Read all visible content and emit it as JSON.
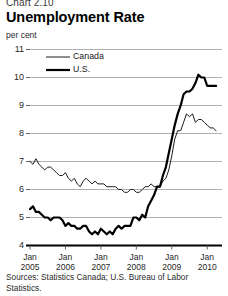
{
  "header": {
    "chart_number": "Chart 2.10",
    "title": "Unemployment Rate",
    "unit_label": "per cent"
  },
  "footer": {
    "sources": "Sources: Statistics Canada; U.S. Bureau of Labor Statistics."
  },
  "legend": {
    "items": [
      {
        "label": "Canada",
        "color": "#1a1a1a",
        "width": 1.0
      },
      {
        "label": "U.S.",
        "color": "#000000",
        "width": 2.2
      }
    ]
  },
  "chart_data": {
    "type": "line",
    "title": "Unemployment Rate",
    "subtitle": "Chart 2.10",
    "xlabel": "",
    "ylabel": "per cent",
    "ylim": [
      4,
      11
    ],
    "yticks": [
      4,
      5,
      6,
      7,
      8,
      9,
      10,
      11
    ],
    "xlim": [
      "2005-01",
      "2010-06"
    ],
    "xticks": [
      "Jan 2005",
      "Jan 2006",
      "Jan 2007",
      "Jan 2008",
      "Jan 2009",
      "Jan 2010"
    ],
    "xtick_labels": [
      {
        "month": "Jan",
        "year": "2005"
      },
      {
        "month": "Jan",
        "year": "2006"
      },
      {
        "month": "Jan",
        "year": "2007"
      },
      {
        "month": "Jan",
        "year": "2008"
      },
      {
        "month": "Jan",
        "year": "2009"
      },
      {
        "month": "Jan",
        "year": "2010"
      }
    ],
    "grid": "horizontal",
    "legend_position": "upper-left",
    "x": [
      "2005-01",
      "2005-02",
      "2005-03",
      "2005-04",
      "2005-05",
      "2005-06",
      "2005-07",
      "2005-08",
      "2005-09",
      "2005-10",
      "2005-11",
      "2005-12",
      "2006-01",
      "2006-02",
      "2006-03",
      "2006-04",
      "2006-05",
      "2006-06",
      "2006-07",
      "2006-08",
      "2006-09",
      "2006-10",
      "2006-11",
      "2006-12",
      "2007-01",
      "2007-02",
      "2007-03",
      "2007-04",
      "2007-05",
      "2007-06",
      "2007-07",
      "2007-08",
      "2007-09",
      "2007-10",
      "2007-11",
      "2007-12",
      "2008-01",
      "2008-02",
      "2008-03",
      "2008-04",
      "2008-05",
      "2008-06",
      "2008-07",
      "2008-08",
      "2008-09",
      "2008-10",
      "2008-11",
      "2008-12",
      "2009-01",
      "2009-02",
      "2009-03",
      "2009-04",
      "2009-05",
      "2009-06",
      "2009-07",
      "2009-08",
      "2009-09",
      "2009-10",
      "2009-11",
      "2009-12",
      "2010-01",
      "2010-02",
      "2010-03",
      "2010-04"
    ],
    "series": [
      {
        "name": "Canada",
        "color": "#1a1a1a",
        "line_width": 1.0,
        "values": [
          7.0,
          6.9,
          7.1,
          6.9,
          6.8,
          6.7,
          6.8,
          6.8,
          6.7,
          6.6,
          6.5,
          6.5,
          6.6,
          6.4,
          6.3,
          6.4,
          6.2,
          6.1,
          6.3,
          6.4,
          6.3,
          6.2,
          6.3,
          6.2,
          6.2,
          6.2,
          6.1,
          6.1,
          6.1,
          6.1,
          6.0,
          6.0,
          5.9,
          5.9,
          6.0,
          6.0,
          5.9,
          5.9,
          6.0,
          6.1,
          6.1,
          6.2,
          6.1,
          6.1,
          6.1,
          6.3,
          6.4,
          6.7,
          7.2,
          7.8,
          8.1,
          8.1,
          8.4,
          8.7,
          8.6,
          8.7,
          8.4,
          8.5,
          8.5,
          8.4,
          8.3,
          8.2,
          8.2,
          8.1
        ]
      },
      {
        "name": "U.S.",
        "color": "#000000",
        "line_width": 2.2,
        "values": [
          5.3,
          5.4,
          5.2,
          5.2,
          5.1,
          5.0,
          5.0,
          4.9,
          5.0,
          5.0,
          5.0,
          4.9,
          4.7,
          4.8,
          4.7,
          4.7,
          4.6,
          4.6,
          4.7,
          4.7,
          4.5,
          4.4,
          4.5,
          4.4,
          4.6,
          4.5,
          4.4,
          4.5,
          4.4,
          4.6,
          4.7,
          4.6,
          4.7,
          4.7,
          4.7,
          5.0,
          5.0,
          4.9,
          5.1,
          5.0,
          5.4,
          5.6,
          5.8,
          6.1,
          6.1,
          6.5,
          6.8,
          7.3,
          7.8,
          8.3,
          8.7,
          9.0,
          9.4,
          9.5,
          9.5,
          9.6,
          9.8,
          10.1,
          10.0,
          10.0,
          9.7,
          9.7,
          9.7,
          9.7
        ]
      }
    ]
  }
}
